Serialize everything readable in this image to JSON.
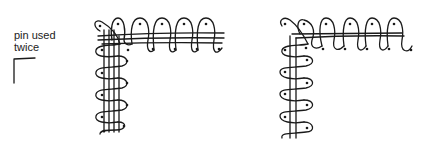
{
  "annotation": {
    "line1": "pin used",
    "line2": "twice"
  },
  "diagrams": [
    {
      "id": "left-corner",
      "description": "corner with pin used twice, braid threads crossing"
    },
    {
      "id": "right-corner",
      "description": "corner with separate loops turning around the corner"
    }
  ],
  "colors": {
    "ink": "#1a1a1a",
    "background": "#ffffff"
  }
}
